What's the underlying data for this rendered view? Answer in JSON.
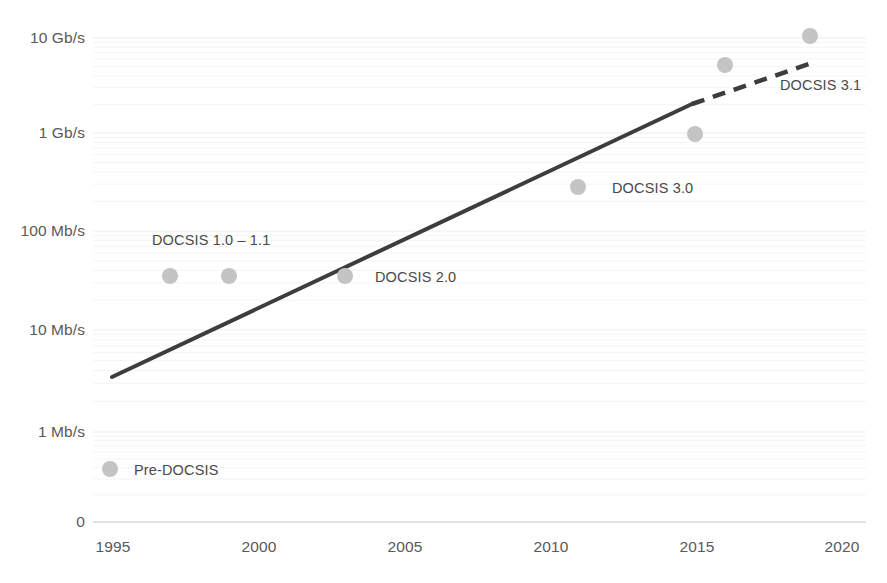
{
  "chart": {
    "type": "scatter",
    "title": "",
    "subtitle": "",
    "xlabel": "",
    "ylabel": "",
    "grid": true,
    "legend_position": "none",
    "colors": {
      "dot": "#c4c4c4",
      "trend_line": "#3d3d3d",
      "gridline_minor": "#f4f4f4",
      "gridline_major": "#ededed",
      "axis_text": "#595959",
      "label_text": "#4a4a4a",
      "background": "#ffffff"
    }
  },
  "chart_data": {
    "type": "scatter",
    "title": "",
    "xlabel": "",
    "ylabel": "",
    "xlim": [
      1995,
      2020
    ],
    "ylim_log_labels": [
      "0",
      "1 Mb/s",
      "10 Mb/s",
      "100 Mb/s",
      "1 Gb/s",
      "10 Gb/s"
    ],
    "y_axis_scale": "log",
    "grid": true,
    "legend_position": "none",
    "x_ticks": [
      "1995",
      "2000",
      "2005",
      "2010",
      "2015",
      "2020"
    ],
    "y_ticks": [
      "10 Gb/s",
      "1 Gb/s",
      "100 Mb/s",
      "10 Mb/s",
      "1 Mb/s",
      "0"
    ],
    "points": [
      {
        "label": "Pre-DOCSIS",
        "x": 1995,
        "y_mbps": 0.5,
        "y_text": "~0.5 Mb/s"
      },
      {
        "label": "DOCSIS 1.0 - 1.1",
        "x": 1997,
        "y_mbps": 40,
        "y_text": "~40 Mb/s"
      },
      {
        "label": "",
        "x": 1999,
        "y_mbps": 40,
        "y_text": "~40 Mb/s"
      },
      {
        "label": "DOCSIS 2.0",
        "x": 2003,
        "y_mbps": 40,
        "y_text": "~40 Mb/s"
      },
      {
        "label": "DOCSIS 3.0",
        "x": 2011,
        "y_mbps": 300,
        "y_text": "~300 Mb/s"
      },
      {
        "label": "",
        "x": 2015,
        "y_mbps": 950,
        "y_text": "~1 Gb/s"
      },
      {
        "label": "",
        "x": 2016,
        "y_mbps": 5000,
        "y_text": "~5 Gb/s"
      },
      {
        "label": "DOCSIS 3.1",
        "x": 2019,
        "y_mbps": 10000,
        "y_text": "10 Gb/s"
      }
    ],
    "trend_line": {
      "solid_segment": {
        "x_start": 1995,
        "y_start_mbps": 4,
        "x_end": 2014.9,
        "y_end_mbps": 2200
      },
      "dashed_segment": {
        "x_start": 2014.9,
        "y_start_mbps": 2200,
        "x_end": 2019,
        "y_end_mbps": 7000
      }
    },
    "annotations": [
      {
        "text": "DOCSIS 1.0 - 1.1",
        "x": 1997,
        "near_y": "just above 100 Mb/s marker row"
      },
      {
        "text": "DOCSIS 2.0",
        "x": 2003,
        "near_y": "40 Mb/s"
      },
      {
        "text": "DOCSIS 3.0",
        "x": 2011,
        "near_y": "300 Mb/s"
      },
      {
        "text": "DOCSIS 3.1",
        "x": 2019,
        "near_y": "between 1 and 10 Gb/s"
      }
    ]
  },
  "y_axis": {
    "ticks": [
      {
        "text": "10 Gb/s",
        "py": 38
      },
      {
        "text": "1 Gb/s",
        "py": 133
      },
      {
        "text": "100 Mb/s",
        "py": 231
      },
      {
        "text": "10 Mb/s",
        "py": 330
      },
      {
        "text": "1 Mb/s",
        "py": 432
      },
      {
        "text": "0",
        "py": 522
      }
    ]
  },
  "x_axis": {
    "ticks": [
      {
        "text": "1995",
        "px": 113
      },
      {
        "text": "2000",
        "px": 259
      },
      {
        "text": "2005",
        "px": 405
      },
      {
        "text": "2010",
        "px": 551
      },
      {
        "text": "2015",
        "px": 697
      },
      {
        "text": "2020",
        "px": 842
      }
    ]
  },
  "series_points": [
    {
      "name": "pre-docsis",
      "px": 110,
      "py": 469,
      "r": 8
    },
    {
      "name": "docsis-1-0",
      "px": 170,
      "py": 276,
      "r": 8
    },
    {
      "name": "docsis-1-1",
      "px": 229,
      "py": 276,
      "r": 8
    },
    {
      "name": "docsis-2-0",
      "px": 345,
      "py": 276,
      "r": 8
    },
    {
      "name": "docsis-3-0",
      "px": 578,
      "py": 187,
      "r": 8
    },
    {
      "name": "docsis-3-1-a",
      "px": 695,
      "py": 134,
      "r": 8
    },
    {
      "name": "docsis-3-1-b",
      "px": 725,
      "py": 65,
      "r": 8
    },
    {
      "name": "docsis-3-1-c",
      "px": 810,
      "py": 36,
      "r": 8
    }
  ],
  "annotation_labels": [
    {
      "name": "label-docsis-1",
      "text": "DOCSIS 1.0 – 1.1",
      "px": 152,
      "py": 240
    },
    {
      "name": "label-docsis-2",
      "text": "DOCSIS 2.0",
      "px": 375,
      "py": 277
    },
    {
      "name": "label-docsis-3-0",
      "text": "DOCSIS 3.0",
      "px": 612,
      "py": 188
    },
    {
      "name": "label-docsis-3-1",
      "text": "DOCSIS 3.1",
      "px": 780,
      "py": 85
    },
    {
      "name": "label-pre-docsis",
      "text": "Pre-DOCSIS",
      "px": 134,
      "py": 470
    }
  ]
}
